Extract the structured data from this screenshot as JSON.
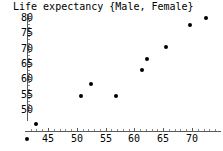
{
  "chart_data": {
    "type": "scatter",
    "title": "Life expectancy {Male, Female}",
    "xlabel": "",
    "ylabel": "",
    "xlim": [
      41,
      74
    ],
    "ylim": [
      44,
      81
    ],
    "grid": false,
    "legend": null,
    "x_ticks": [
      45,
      50,
      55,
      60,
      65,
      70
    ],
    "y_ticks": [
      50,
      55,
      60,
      65,
      70,
      75,
      80
    ],
    "series": [
      {
        "name": "Life expectancy {Male, Female}",
        "marker": "filled-circle",
        "color": "#000000",
        "points": [
          {
            "x": 42.9,
            "y": 45.5
          },
          {
            "x": 50.7,
            "y": 54.5
          },
          {
            "x": 52.5,
            "y": 58.4
          },
          {
            "x": 56.8,
            "y": 54.5
          },
          {
            "x": 61.3,
            "y": 63.0
          },
          {
            "x": 62.2,
            "y": 66.6
          },
          {
            "x": 65.5,
            "y": 70.5
          },
          {
            "x": 69.6,
            "y": 77.7
          },
          {
            "x": 72.5,
            "y": 80.0
          }
        ]
      }
    ]
  },
  "axis_colors": {
    "axis_line": "#5a5a5a",
    "tick": "#5a5a5a",
    "text": "#000000",
    "background": "#ffffff"
  }
}
